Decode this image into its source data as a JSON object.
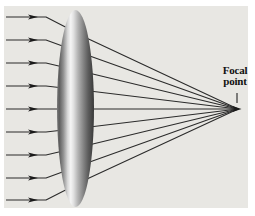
{
  "figure": {
    "type": "optics-diagram",
    "labels": {
      "focal_point": "Focal point"
    },
    "colors": {
      "page_bg": "#ffffff",
      "panel_bg": "#e8e7e3",
      "ray": "#2b2b2b",
      "label_text": "#111111",
      "arrow": "#1a1a1a",
      "lens_gradient": [
        {
          "offset": 0.0,
          "color": "#7a7a7a"
        },
        {
          "offset": 0.06,
          "color": "#5c5c5c"
        },
        {
          "offset": 0.17,
          "color": "#909090"
        },
        {
          "offset": 0.29,
          "color": "#d9d9d9"
        },
        {
          "offset": 0.37,
          "color": "#f5f5f5"
        },
        {
          "offset": 0.45,
          "color": "#e0e0e0"
        },
        {
          "offset": 0.57,
          "color": "#b2b2b2"
        },
        {
          "offset": 0.7,
          "color": "#888888"
        },
        {
          "offset": 0.84,
          "color": "#5d5d5d"
        },
        {
          "offset": 0.94,
          "color": "#464646"
        },
        {
          "offset": 1.0,
          "color": "#393939"
        }
      ]
    },
    "geometry": {
      "canvas": {
        "w": 255,
        "h": 216
      },
      "panel": {
        "x": 4,
        "y": 6,
        "w": 244,
        "h": 202
      },
      "rays_y": [
        17,
        40,
        63,
        86,
        109,
        132,
        155,
        178,
        200
      ],
      "axis_y": 109,
      "ray_start_x": 6,
      "ray_bend_x": 46,
      "ray_arrow_tip_x": 38,
      "exit_converge_factor": 0.24,
      "lens": {
        "cx": 75.5,
        "cy": 108.5,
        "rx": 18.5,
        "ry": 98.5
      },
      "focal_point": {
        "x": 238,
        "y": 109
      },
      "focal_arrow_tip_x": 241.5,
      "pointer_line": {
        "x": 237,
        "y1": 93,
        "y2": 103
      }
    }
  }
}
